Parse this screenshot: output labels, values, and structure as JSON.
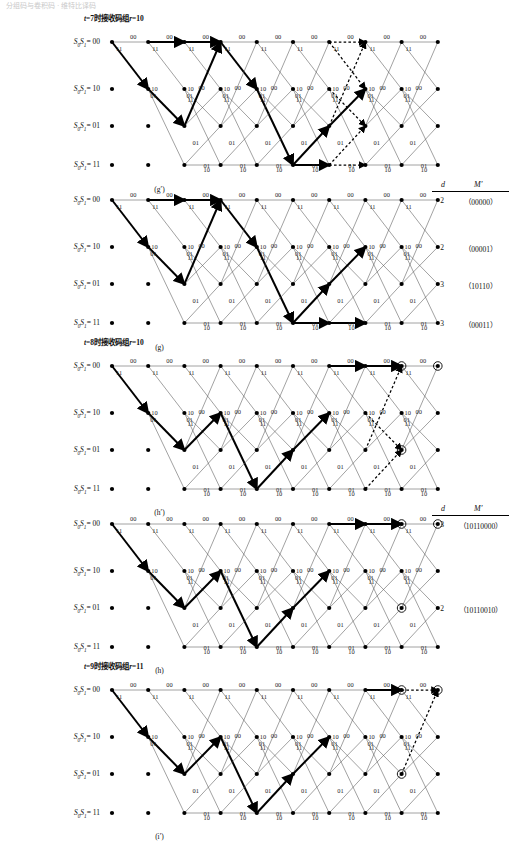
{
  "page": {
    "cut_off_header": "分组码与卷积码 · 维特比译码",
    "width": 509,
    "height": 846,
    "ink": "#000000",
    "thin_line": "#3a3a3a",
    "dashed": true
  },
  "state_labels": [
    {
      "prefix": "S",
      "sub0": "0",
      "mid": "S",
      "sub1": "1",
      "eq": "= 00",
      "value": "00"
    },
    {
      "prefix": "S",
      "sub0": "0",
      "mid": "S",
      "sub1": "1",
      "eq": "= 10",
      "value": "10"
    },
    {
      "prefix": "S",
      "sub0": "0",
      "mid": "S",
      "sub1": "1",
      "eq": "= 01",
      "value": "01"
    },
    {
      "prefix": "S",
      "sub0": "0",
      "mid": "S",
      "sub1": "1",
      "eq": "= 11",
      "value": "11"
    }
  ],
  "edge_labels": {
    "top_row": "00",
    "from00_down": "11",
    "row10_right": "10",
    "row10_up": "00",
    "row01_label": "01",
    "bottom_row": "10",
    "diag_up": "11",
    "mid_01": "01"
  },
  "dm_header": {
    "d": "d",
    "m": "M′"
  },
  "panels": [
    {
      "id": "g-prime",
      "caption": "(g′)",
      "title": {
        "t_label": "t",
        "t_eq": "=7",
        "cn": "时接收码组",
        "r_label": "r",
        "r_eq": "=10"
      },
      "has_title": true,
      "has_dm": false,
      "columns": 10,
      "dashed_cols": [
        6,
        7
      ],
      "circled": [],
      "dm_rows": []
    },
    {
      "id": "g",
      "caption": "(g)",
      "title": null,
      "has_title": false,
      "has_dm": true,
      "columns": 10,
      "dashed_cols": [],
      "circled": [],
      "dm_rows": [
        {
          "state": "00",
          "d": "2",
          "m": "（00000）"
        },
        {
          "state": "10",
          "d": "2",
          "m": "（00001）"
        },
        {
          "state": "01",
          "d": "3",
          "m": "（10110）"
        },
        {
          "state": "11",
          "d": "3",
          "m": "（00011）"
        }
      ]
    },
    {
      "id": "h-prime",
      "caption": "(h′)",
      "title": {
        "t_label": "t",
        "t_eq": "=8",
        "cn": "时接收码组",
        "r_label": "r",
        "r_eq": "=10"
      },
      "has_title": true,
      "has_dm": false,
      "columns": 10,
      "dashed_cols": [
        7,
        8
      ],
      "circled": [
        [
          8,
          0
        ],
        [
          9,
          0
        ],
        [
          8,
          2
        ]
      ],
      "dm_rows": []
    },
    {
      "id": "h",
      "caption": "(h)",
      "title": null,
      "has_title": false,
      "has_dm": true,
      "columns": 10,
      "dashed_cols": [],
      "circled": [
        [
          8,
          0
        ],
        [
          9,
          0
        ],
        [
          8,
          2
        ]
      ],
      "dm_rows": [
        {
          "state": "00",
          "d": "3",
          "m": "（10110000）"
        },
        {
          "state": "01",
          "d": "2",
          "m": "（10110010）"
        }
      ]
    },
    {
      "id": "i-prime",
      "caption": "(i′)",
      "title": {
        "t_label": "t",
        "t_eq": "=9",
        "cn": "时接收码组",
        "r_label": "r",
        "r_eq": "=11"
      },
      "has_title": true,
      "has_dm": false,
      "columns": 10,
      "dashed_cols": [
        8,
        9
      ],
      "circled": [
        [
          8,
          0
        ],
        [
          9,
          0
        ],
        [
          8,
          2
        ]
      ],
      "dm_rows": []
    }
  ]
}
